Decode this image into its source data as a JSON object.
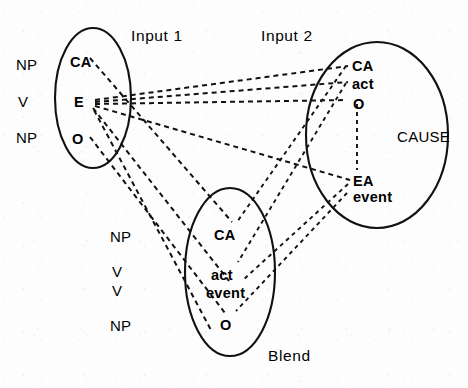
{
  "figure": {
    "type": "conceptual-blending-diagram",
    "title": "",
    "stroke_color": "#111111",
    "background_color": "#fdfdfd"
  },
  "spaces": {
    "input1": {
      "title": "Input 1",
      "title_pos": {
        "x": 131,
        "y": 28
      },
      "ellipse": {
        "cx": 93,
        "cy": 98,
        "rx": 38,
        "ry": 70
      },
      "elements": [
        {
          "id": "input1-ca",
          "label": "CA",
          "x": 70,
          "y": 55,
          "style": "bold"
        },
        {
          "id": "input1-e",
          "label": "E",
          "x": 74,
          "y": 95,
          "style": "bold"
        },
        {
          "id": "input1-o",
          "label": "O",
          "x": 72,
          "y": 132,
          "style": "bold"
        }
      ],
      "role_labels": [
        {
          "id": "input1-role-np-1",
          "label": "NP",
          "x": 16,
          "y": 57
        },
        {
          "id": "input1-role-v",
          "label": "V",
          "x": 18,
          "y": 94
        },
        {
          "id": "input1-role-np-2",
          "label": "NP",
          "x": 16,
          "y": 130
        }
      ]
    },
    "input2": {
      "title": "Input 2",
      "title_pos": {
        "x": 261,
        "y": 28
      },
      "ellipse": {
        "cx": 377,
        "cy": 135,
        "rx": 71,
        "ry": 93
      },
      "annotation": {
        "id": "input2-cause",
        "label": "CAUSE",
        "x": 397,
        "y": 129
      },
      "elements": [
        {
          "id": "input2-ca",
          "label": "CA",
          "x": 352,
          "y": 59,
          "style": "bold"
        },
        {
          "id": "input2-act",
          "label": "act",
          "x": 352,
          "y": 77,
          "style": "bold"
        },
        {
          "id": "input2-o",
          "label": "O",
          "x": 353,
          "y": 97,
          "style": "bold"
        },
        {
          "id": "input2-ea",
          "label": "EA",
          "x": 353,
          "y": 174,
          "style": "bold"
        },
        {
          "id": "input2-event",
          "label": "event",
          "x": 353,
          "y": 190,
          "style": "bold"
        }
      ]
    },
    "blend": {
      "title": "Blend",
      "title_pos": {
        "x": 268,
        "y": 348
      },
      "ellipse": {
        "cx": 230,
        "cy": 272,
        "rx": 45,
        "ry": 84
      },
      "elements": [
        {
          "id": "blend-ca",
          "label": "CA",
          "x": 214,
          "y": 228,
          "style": "bold"
        },
        {
          "id": "blend-act",
          "label": "act",
          "x": 211,
          "y": 268,
          "style": "bold"
        },
        {
          "id": "blend-event",
          "label": "event",
          "x": 206,
          "y": 286,
          "style": "bold"
        },
        {
          "id": "blend-o",
          "label": "O",
          "x": 220,
          "y": 318,
          "style": "bold"
        }
      ],
      "role_labels": [
        {
          "id": "blend-role-np-1",
          "label": "NP",
          "x": 110,
          "y": 229
        },
        {
          "id": "blend-role-v-1",
          "label": "V",
          "x": 112,
          "y": 264
        },
        {
          "id": "blend-role-v-2",
          "label": "V",
          "x": 112,
          "y": 283
        },
        {
          "id": "blend-role-np-2",
          "label": "NP",
          "x": 110,
          "y": 318
        }
      ]
    }
  },
  "connections": {
    "cross_space_mappings": [
      {
        "id": "map-i1ca-blendca",
        "from": "input1-ca",
        "to": "blend-ca",
        "d": "M 90 58 L 232 222"
      },
      {
        "id": "map-i1e-i2ca",
        "from": "input1-e",
        "to": "input2-ca",
        "d": "M 93 100 L 348 66"
      },
      {
        "id": "map-i1e-i2act",
        "from": "input1-e",
        "to": "input2-act",
        "d": "M 93 103 L 348 83"
      },
      {
        "id": "map-i1e-i2o",
        "from": "input1-e",
        "to": "input2-o",
        "d": "M 93 105 L 346 103"
      },
      {
        "id": "map-i1e-i2ea",
        "from": "input1-e",
        "to": "input2-ea",
        "d": "M 93 107 L 349 181"
      },
      {
        "id": "map-i1e-blendevent",
        "from": "input1-e",
        "to": "blend-event",
        "d": "M 92 109 L 228 282"
      },
      {
        "id": "map-i1o-blendo",
        "from": "input1-o",
        "to": "blend-o",
        "d": "M 90 137 L 226 312"
      },
      {
        "id": "map-i2ca-blendca",
        "from": "input2-ca",
        "to": "blend-ca",
        "d": "M 347 66 L 237 223"
      },
      {
        "id": "map-i2act-blendact",
        "from": "input2-act",
        "to": "blend-act",
        "d": "M 347 83 L 237 263"
      },
      {
        "id": "map-i2ea-blendevent",
        "from": "input2-ea",
        "to": "blend-event",
        "d": "M 348 184 L 241 281"
      },
      {
        "id": "map-i2event-blendo",
        "from": "input2-event",
        "to": "blend-o",
        "d": "M 348 192 L 236 312"
      },
      {
        "id": "map-i1cross-lower",
        "from": "input1-e",
        "to": "blend-lower",
        "d": "M 94 111 L 214 330"
      }
    ],
    "inner_relations": [
      {
        "id": "inner-i2-o-ea",
        "space": "input2",
        "from": "input2-o",
        "to": "input2-ea",
        "d": "M 357 104 L 357 170"
      }
    ]
  }
}
